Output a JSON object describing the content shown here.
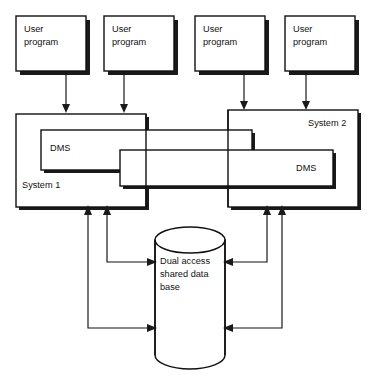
{
  "diagram": {
    "colors": {
      "stroke": "#111111",
      "fill": "#ffffff",
      "shadow": "#1a1a1a"
    },
    "user_programs": [
      {
        "line1": "User",
        "line2": "program"
      },
      {
        "line1": "User",
        "line2": "program"
      },
      {
        "line1": "User",
        "line2": "program"
      },
      {
        "line1": "User",
        "line2": "program"
      }
    ],
    "systems": [
      {
        "label": "System 1",
        "dms_label": "DMS"
      },
      {
        "label": "System 2",
        "dms_label": "DMS"
      }
    ],
    "database": {
      "line1": "Dual access",
      "line2": "shared data",
      "line3": "base"
    }
  }
}
